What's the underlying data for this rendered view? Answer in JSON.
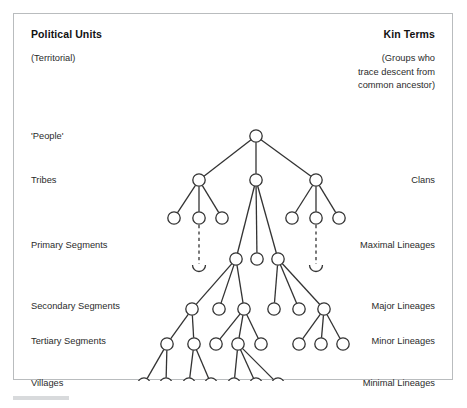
{
  "figure": {
    "title_left": "Political Units",
    "title_right": "Kin Terms",
    "subtitle_left": "(Territorial)",
    "subtitle_right": "(Groups who\ntrace descent from\ncommon ancestor)",
    "frame_color": "#b9bcbe",
    "node_stroke": "#333333",
    "node_fill": "#ffffff",
    "edge_color": "#333333",
    "background": "#ffffff"
  },
  "rows": [
    {
      "y": 122,
      "left": "'People'",
      "right": ""
    },
    {
      "y": 166,
      "left": "Tribes",
      "right": "Clans"
    },
    {
      "y": 204,
      "left": "Primary Segments",
      "right": "Maximal Lineages"
    },
    {
      "y": 245,
      "left": "",
      "right": ""
    },
    {
      "y": 295,
      "left": "Secondary Segments",
      "right": "Major Lineages"
    },
    {
      "y": 330,
      "left": "Tertiary Segments",
      "right": "Minor Lineages"
    },
    {
      "y": 370,
      "left": "Villages",
      "right": "Minimal Lineages"
    }
  ],
  "row_label_placement": [
    {
      "text": "'People'",
      "side": "left",
      "y": 122
    },
    {
      "text": "Tribes",
      "side": "left",
      "y": 166
    },
    {
      "text": "Clans",
      "side": "right",
      "y": 166
    },
    {
      "text": "Primary Segments",
      "side": "left",
      "y": 231
    },
    {
      "text": "Maximal Lineages",
      "side": "right",
      "y": 231
    },
    {
      "text": "Secondary Segments",
      "side": "left",
      "y": 292
    },
    {
      "text": "Major Lineages",
      "side": "right",
      "y": 292
    },
    {
      "text": "Tertiary Segments",
      "side": "left",
      "y": 327
    },
    {
      "text": "Minor Lineages",
      "side": "right",
      "y": 327
    },
    {
      "text": "Villages",
      "side": "left",
      "y": 369
    },
    {
      "text": "Minimal Lineages",
      "side": "right",
      "y": 369
    }
  ],
  "chart_data": {
    "type": "diagram",
    "diagram_kind": "segmentary-lineage-tree",
    "node_radius": 6.2,
    "levels": [
      {
        "name": "people",
        "y": 122,
        "xs": [
          242
        ]
      },
      {
        "name": "tribes",
        "y": 166,
        "xs": [
          185,
          242,
          302
        ]
      },
      {
        "name": "primary",
        "y": 204,
        "xs": [
          160,
          185,
          208,
          278,
          302,
          325
        ]
      },
      {
        "name": "maximal",
        "y": 245,
        "xs": [
          222,
          243,
          264
        ]
      },
      {
        "name": "secondary",
        "y": 295,
        "xs": [
          178,
          205,
          230,
          260,
          285,
          310
        ]
      },
      {
        "name": "tertiary",
        "y": 330,
        "xs": [
          153,
          180,
          202,
          224,
          247,
          285,
          307,
          329
        ]
      },
      {
        "name": "villages",
        "y": 370,
        "xs": [
          130,
          152,
          175,
          197,
          220,
          242,
          264
        ]
      }
    ],
    "edges": [
      [
        242,
        122,
        185,
        166
      ],
      [
        242,
        122,
        242,
        166
      ],
      [
        242,
        122,
        302,
        166
      ],
      [
        185,
        166,
        160,
        204
      ],
      [
        185,
        166,
        185,
        204
      ],
      [
        185,
        166,
        208,
        204
      ],
      [
        302,
        166,
        278,
        204
      ],
      [
        302,
        166,
        302,
        204
      ],
      [
        302,
        166,
        325,
        204
      ],
      [
        242,
        166,
        222,
        245
      ],
      [
        242,
        166,
        243,
        245
      ],
      [
        242,
        166,
        264,
        245
      ],
      [
        222,
        245,
        178,
        295
      ],
      [
        222,
        245,
        205,
        295
      ],
      [
        222,
        245,
        230,
        295
      ],
      [
        264,
        245,
        260,
        295
      ],
      [
        264,
        245,
        285,
        295
      ],
      [
        264,
        245,
        310,
        295
      ],
      [
        230,
        295,
        202,
        330
      ],
      [
        230,
        295,
        224,
        330
      ],
      [
        230,
        295,
        247,
        330
      ],
      [
        178,
        295,
        153,
        330
      ],
      [
        178,
        295,
        180,
        330
      ],
      [
        310,
        295,
        285,
        330
      ],
      [
        310,
        295,
        307,
        330
      ],
      [
        310,
        295,
        329,
        330
      ],
      [
        153,
        330,
        130,
        370
      ],
      [
        153,
        330,
        152,
        370
      ],
      [
        180,
        330,
        175,
        370
      ],
      [
        180,
        330,
        197,
        370
      ],
      [
        224,
        330,
        220,
        370
      ],
      [
        224,
        330,
        242,
        370
      ],
      [
        224,
        330,
        264,
        370
      ]
    ],
    "dashed_connectors": [
      {
        "x": 185,
        "y_top": 211,
        "y_bottom": 250,
        "arc": true
      },
      {
        "x": 302,
        "y_top": 211,
        "y_bottom": 250,
        "arc": true
      }
    ],
    "counts": {
      "people": 1,
      "tribes": 3,
      "primary": 6,
      "maximal": 3,
      "secondary": 6,
      "tertiary": 8,
      "villages": 7
    }
  }
}
